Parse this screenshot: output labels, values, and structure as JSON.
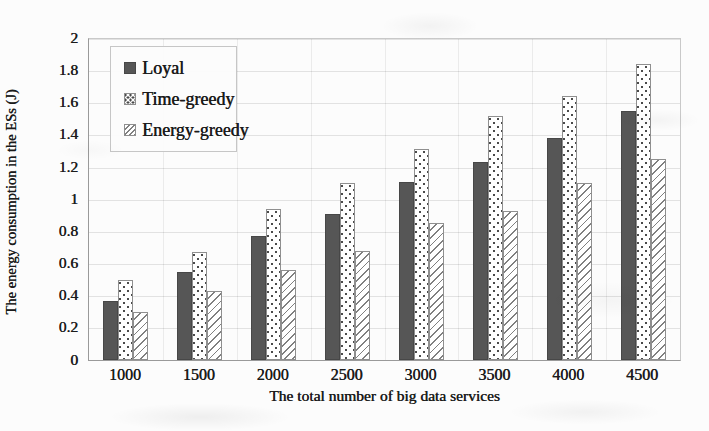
{
  "figure": {
    "background_color": "#fcfcfc",
    "text_color": "#1b1b1b"
  },
  "colors": {
    "loyal_fill": "#565656",
    "pattern_dot": "#4a4a4a",
    "pattern_line": "#808080",
    "patterned_bar_background": "#ffffff",
    "bar_border": "#8f8f8f",
    "gridline": "#d9d9d9",
    "axis_line": "#9a9a9a"
  },
  "chart_data": {
    "type": "bar",
    "title": "",
    "xlabel": "The total number of big data services",
    "ylabel": "The energy consumption in the ESs (J)",
    "categories": [
      "1000",
      "1500",
      "2000",
      "2500",
      "3000",
      "3500",
      "4000",
      "4500"
    ],
    "series": [
      {
        "name": "Loyal",
        "pattern": "solid-dark-gray",
        "values": [
          0.37,
          0.55,
          0.77,
          0.91,
          1.11,
          1.23,
          1.38,
          1.55
        ]
      },
      {
        "name": "Time-greedy",
        "pattern": "dotted",
        "values": [
          0.5,
          0.67,
          0.94,
          1.1,
          1.31,
          1.52,
          1.64,
          1.84
        ]
      },
      {
        "name": "Energy-greedy",
        "pattern": "diagonal-hatch",
        "values": [
          0.3,
          0.43,
          0.56,
          0.68,
          0.85,
          0.93,
          1.1,
          1.25
        ]
      }
    ],
    "ylim": [
      0,
      2
    ],
    "ytick_step": 0.2,
    "ytick_labels": [
      "0",
      "0.2",
      "0.4",
      "0.6",
      "0.8",
      "1",
      "1.2",
      "1.4",
      "1.6",
      "1.8",
      "2"
    ],
    "grid": "both",
    "legend_position": "upper-left-inside"
  }
}
